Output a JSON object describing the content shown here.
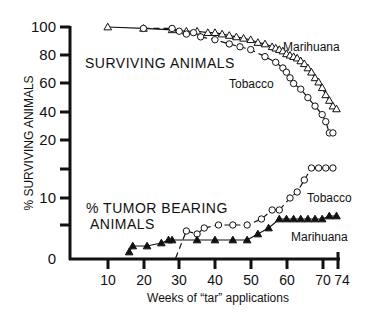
{
  "chart_data": {
    "type": "line",
    "title": "",
    "xlabel": "Weeks of “tar” applications",
    "ylabel": "% SURVIVING ANIMALS",
    "x_ticks": [
      10,
      20,
      30,
      40,
      50,
      60,
      70,
      74
    ],
    "xlim": [
      0,
      74
    ],
    "grid": false,
    "legend_position": "inline labels",
    "panels": [
      {
        "name": "surviving",
        "annotation": "SURVIVING ANIMALS",
        "y_ticks": [
          20,
          40,
          60,
          80,
          100
        ],
        "ylim": [
          20,
          100
        ],
        "series": [
          {
            "name": "Marihuana",
            "marker": "open-triangle",
            "line": "solid",
            "x": [
              10,
              20,
              28,
              32,
              35,
              38,
              40,
              42,
              44,
              46,
              48,
              50,
              52,
              54,
              56,
              57,
              58,
              59,
              60,
              61,
              62,
              63,
              64,
              65,
              66,
              67,
              68,
              69,
              70,
              71,
              72,
              73,
              74
            ],
            "y": [
              100,
              99,
              98,
              97,
              97,
              96,
              96,
              95,
              94,
              93,
              92,
              91,
              89,
              88,
              86,
              85,
              84,
              83,
              81,
              80,
              79,
              78,
              76,
              74,
              71,
              68,
              64,
              61,
              57,
              52,
              48,
              44,
              42
            ]
          },
          {
            "name": "Tobacco",
            "marker": "open-circle",
            "line": "dashed",
            "x": [
              20,
              28,
              30,
              32,
              34,
              36,
              40,
              44,
              47,
              50,
              54,
              57,
              59,
              60,
              61,
              62,
              64,
              66,
              68,
              70,
              71,
              72,
              73
            ],
            "y": [
              99,
              99,
              97,
              95,
              96,
              93,
              91,
              88,
              86,
              84,
              79,
              75,
              71,
              68,
              64,
              60,
              56,
              50,
              44,
              38,
              33,
              25,
              25
            ]
          }
        ]
      },
      {
        "name": "tumor",
        "annotation": "% TUMOR BEARING ANIMALS",
        "y_ticks": [
          0,
          10
        ],
        "ylim": [
          0,
          15
        ],
        "series": [
          {
            "name": "Tobacco",
            "marker": "open-circle",
            "line": "dashed",
            "x": [
              29,
              32,
              35,
              37,
              41,
              45,
              49,
              53,
              56,
              58,
              61,
              63,
              65,
              67,
              69,
              71,
              73
            ],
            "y": [
              0,
              4.5,
              4,
              5,
              5.5,
              5.5,
              5.5,
              6.5,
              8,
              8,
              10,
              11,
              13,
              15,
              15,
              15,
              15
            ]
          },
          {
            "name": "Marihuana",
            "marker": "filled-triangle",
            "line": "solid",
            "x": [
              16,
              17,
              21,
              25,
              27,
              28,
              35,
              40,
              45,
              49,
              52,
              55,
              58,
              60,
              62,
              64,
              66,
              68,
              70,
              72,
              74
            ],
            "y": [
              1,
              2,
              2,
              2.5,
              3,
              3,
              3,
              3,
              3,
              3,
              4,
              5,
              6.5,
              6.5,
              6.5,
              6.5,
              6.5,
              6.5,
              6.5,
              7,
              7
            ]
          }
        ]
      }
    ]
  },
  "labels": {
    "y_axis_title": "% SURVIVING ANIMALS",
    "x_axis_title": "Weeks of “tar” applications",
    "surviving_annotation": "SURVIVING ANIMALS",
    "tumor_annotation_line1": "% TUMOR BEARING",
    "tumor_annotation_line2": "ANIMALS",
    "surv_marihuana": "Marihuana",
    "surv_tobacco": "Tobacco",
    "tumor_tobacco": "Tobacco",
    "tumor_marihuana": "Marihuana",
    "y_ticks": [
      "100",
      "80",
      "60",
      "40",
      "20",
      "10",
      "0"
    ],
    "x_ticks": [
      "10",
      "20",
      "30",
      "40",
      "50",
      "60",
      "70",
      "74"
    ]
  }
}
